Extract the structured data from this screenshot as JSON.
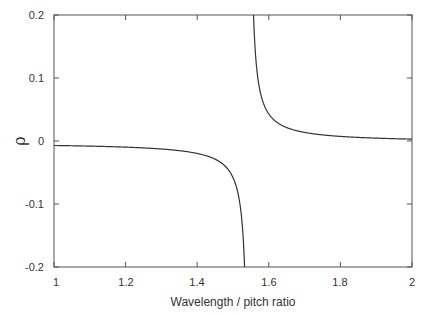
{
  "chart_data": {
    "type": "line",
    "title": "",
    "xlabel": "Wavelength / pitch ratio",
    "ylabel": "ρ",
    "xlim": [
      1,
      2
    ],
    "ylim": [
      -0.2,
      0.2
    ],
    "xticks": [
      1,
      1.2,
      1.4,
      1.6,
      1.8,
      2
    ],
    "xtick_labels": [
      "1",
      "1.2",
      "1.4",
      "1.6",
      "1.8",
      "2"
    ],
    "yticks": [
      0.2,
      0.1,
      0,
      -0.1,
      -0.2
    ],
    "ytick_labels": [
      "0.2",
      "0.1",
      "0",
      "-0.1",
      "-0.2"
    ],
    "grid": false,
    "legend": null,
    "asymptote_x": 1.545,
    "series": [
      {
        "name": "rho",
        "color": "#333333",
        "x": [
          1.0,
          1.1,
          1.2,
          1.3,
          1.4,
          1.45,
          1.5,
          1.52,
          1.53,
          1.532,
          1.558,
          1.56,
          1.57,
          1.6,
          1.65,
          1.7,
          1.8,
          1.9,
          2.0
        ],
        "y": [
          -0.007,
          -0.0081,
          -0.0097,
          -0.0127,
          -0.0197,
          -0.029,
          -0.058,
          -0.103,
          -0.169,
          -0.2,
          0.2,
          0.164,
          0.098,
          0.043,
          0.021,
          0.014,
          0.0073,
          0.0045,
          0.003
        ]
      }
    ]
  },
  "labels": {
    "xlabel": "Wavelength / pitch ratio",
    "ylabel": "ρ",
    "xticks": [
      "1",
      "1.2",
      "1.4",
      "1.6",
      "1.8",
      "2"
    ],
    "yticks": [
      "0.2",
      "0.1",
      "0",
      "-0.1",
      "-0.2"
    ]
  }
}
